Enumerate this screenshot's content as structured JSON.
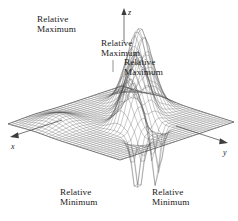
{
  "figure": {
    "background_color": "#ffffff",
    "line_color": "#3a3a3a",
    "text_color": "#222222"
  },
  "axes": {
    "z": {
      "label": "z",
      "direction": "up"
    },
    "x": {
      "label": "x",
      "direction": "down-left"
    },
    "y": {
      "label": "y",
      "direction": "down-right"
    }
  },
  "annotations": [
    {
      "id": "max1",
      "line1": "Relative",
      "line2": "Maximum",
      "kind": "maximum"
    },
    {
      "id": "max2",
      "line1": "Relative",
      "line2": "Maximum",
      "kind": "maximum"
    },
    {
      "id": "max3",
      "line1": "Relative",
      "line2": "Maximum",
      "kind": "maximum"
    },
    {
      "id": "min1",
      "line1": "Relative",
      "line2": "Minimum",
      "kind": "minimum"
    },
    {
      "id": "min2",
      "line1": "Relative",
      "line2": "Minimum",
      "kind": "minimum"
    }
  ],
  "chart_data": {
    "type": "surface",
    "title": "",
    "xlabel": "x",
    "ylabel": "y",
    "zlabel": "z",
    "grid": true,
    "legend": "none",
    "projection": "3d-wireframe-mesh",
    "mesh": {
      "u_lines": 34,
      "v_lines": 34,
      "style": "wireframe",
      "shaded": false
    },
    "features": [
      {
        "type": "relative maximum",
        "label": "Relative Maximum",
        "screen_xy": [
          78,
          50
        ],
        "rank": 1,
        "relative_height": 1.0
      },
      {
        "type": "relative maximum",
        "label": "Relative Maximum",
        "screen_xy": [
          98,
          63
        ],
        "rank": 2,
        "relative_height": 0.82
      },
      {
        "type": "relative maximum",
        "label": "Relative Maximum",
        "screen_xy": [
          117,
          79
        ],
        "rank": 3,
        "relative_height": 0.64
      },
      {
        "type": "relative minimum",
        "label": "Relative Minimum",
        "screen_xy": [
          114,
          190
        ],
        "rank": 1,
        "relative_height": -0.78
      },
      {
        "type": "relative minimum",
        "label": "Relative Minimum",
        "screen_xy": [
          150,
          190
        ],
        "rank": 2,
        "relative_height": -0.74
      }
    ],
    "peaks_count": 3,
    "valleys_count": 2
  }
}
